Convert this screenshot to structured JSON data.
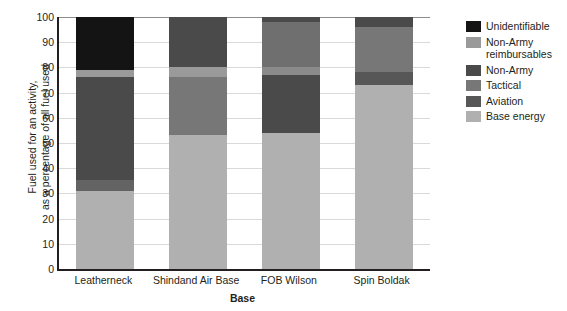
{
  "chart_data": {
    "type": "bar",
    "subtype": "stacked-bar-100",
    "title": "",
    "xlabel": "Base",
    "ylabel": "Fuel used for an activity, as a percentage of all fuel used",
    "ylabel_line1": "Fuel used for an activity,",
    "ylabel_line2": "as a percentage of all fuel used",
    "categories": [
      "Leatherneck",
      "Shindand Air Base",
      "FOB Wilson",
      "Spin Boldak"
    ],
    "ylim": [
      0,
      100
    ],
    "yticks": [
      0,
      10,
      20,
      30,
      40,
      50,
      60,
      70,
      80,
      90,
      100
    ],
    "ytick_labels": [
      "0",
      "10",
      "20",
      "30",
      "40",
      "50",
      "60",
      "70",
      "80",
      "90",
      "100"
    ],
    "grid": true,
    "legend_position": "right",
    "series": [
      {
        "name": "Base energy",
        "color": "#b0b0b0",
        "values": [
          31,
          53,
          54,
          73
        ]
      },
      {
        "name": "Aviation",
        "color": "#636363",
        "values": [
          4.5,
          0,
          0,
          5
        ]
      },
      {
        "name": "Tactical",
        "color": "#777777",
        "values": [
          0,
          23,
          23,
          18
        ]
      },
      {
        "name": "Non-Army",
        "color": "#4a4a4a",
        "values": [
          40.5,
          0,
          0,
          4
        ]
      },
      {
        "name": "Non-Army reimbursables",
        "color": "#9a9a9a",
        "values": [
          3,
          4,
          4,
          0
        ]
      },
      {
        "name": "Unidentifiable",
        "color": "#141414",
        "values": [
          21,
          0,
          0,
          0
        ]
      }
    ],
    "stack_order_bottom_to_top": [
      "Base energy",
      "Aviation",
      "Tactical",
      "Non-Army",
      "Non-Army reimbursables",
      "Unidentifiable"
    ],
    "bars": [
      {
        "category": "Leatherneck",
        "segments": [
          {
            "label": "Base energy",
            "from": 0,
            "to": 31,
            "color": "#b0b0b0"
          },
          {
            "label": "Aviation",
            "from": 31,
            "to": 35.5,
            "color": "#636363"
          },
          {
            "label": "Non-Army",
            "from": 35.5,
            "to": 76,
            "color": "#4a4a4a"
          },
          {
            "label": "Non-Army reimbursables",
            "from": 76,
            "to": 79,
            "color": "#9a9a9a"
          },
          {
            "label": "Unidentifiable",
            "from": 79,
            "to": 100,
            "color": "#141414"
          }
        ]
      },
      {
        "category": "Shindand Air Base",
        "segments": [
          {
            "label": "Base energy",
            "from": 0,
            "to": 53,
            "color": "#b0b0b0"
          },
          {
            "label": "Tactical",
            "from": 53,
            "to": 76,
            "color": "#777777"
          },
          {
            "label": "Non-Army reimbursables",
            "from": 76,
            "to": 80,
            "color": "#9a9a9a"
          },
          {
            "label": "Non-Army",
            "from": 80,
            "to": 100,
            "color": "#4a4a4a"
          }
        ]
      },
      {
        "category": "FOB Wilson",
        "segments": [
          {
            "label": "Base energy",
            "from": 0,
            "to": 54,
            "color": "#b0b0b0"
          },
          {
            "label": "Tactical",
            "from": 54,
            "to": 77,
            "color": "#4a4a4a"
          },
          {
            "label": "Non-Army reimbursables",
            "from": 77,
            "to": 80,
            "color": "#8a8a8a"
          },
          {
            "label": "Tactical",
            "from": 80,
            "to": 98,
            "color": "#6f6f6f"
          },
          {
            "label": "Non-Army",
            "from": 98,
            "to": 100,
            "color": "#4a4a4a"
          }
        ]
      },
      {
        "category": "Spin Boldak",
        "segments": [
          {
            "label": "Base energy",
            "from": 0,
            "to": 73,
            "color": "#b0b0b0"
          },
          {
            "label": "Aviation",
            "from": 73,
            "to": 78,
            "color": "#575757"
          },
          {
            "label": "Tactical",
            "from": 78,
            "to": 96,
            "color": "#777777"
          },
          {
            "label": "Non-Army",
            "from": 96,
            "to": 100,
            "color": "#4a4a4a"
          }
        ]
      }
    ],
    "legend": [
      {
        "label": "Unidentifiable",
        "color": "#141414"
      },
      {
        "label": "Non-Army\nreimbursables",
        "label_line1": "Non-Army",
        "label_line2": "reimbursables",
        "color": "#9a9a9a"
      },
      {
        "label": "Non-Army",
        "color": "#4a4a4a"
      },
      {
        "label": "Tactical",
        "color": "#777777"
      },
      {
        "label": "Aviation",
        "color": "#575757"
      },
      {
        "label": "Base energy",
        "color": "#b0b0b0"
      }
    ]
  }
}
